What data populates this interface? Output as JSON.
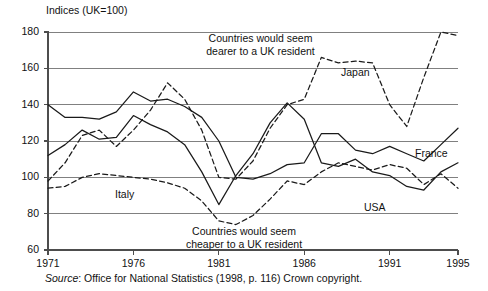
{
  "axis_title": "Indices (UK=100)",
  "source_prefix": "Source",
  "source_text": ": Office for National Statistics (1998, p. 116) Crown copyright.",
  "annotations": {
    "top_line1": "Countries would seem",
    "top_line2": "dearer to a UK resident",
    "bottom_line1": "Countries would seem",
    "bottom_line2": "cheaper to a UK resident"
  },
  "series_labels": {
    "japan": "Japan",
    "france": "France",
    "usa": "USA",
    "italy": "Italy"
  },
  "chart_data": {
    "type": "line",
    "title": "",
    "subtitle": "",
    "xlabel": "",
    "ylabel": "Indices (UK=100)",
    "xlim": [
      1971,
      1995
    ],
    "ylim": [
      60,
      180
    ],
    "ytick_labels": [
      "180",
      "160",
      "140",
      "120",
      "100",
      "80",
      "60"
    ],
    "ytick_values": [
      180,
      160,
      140,
      120,
      100,
      80,
      60
    ],
    "xtick_labels": [
      "1971",
      "1976",
      "1981",
      "1986",
      "1991",
      "1995"
    ],
    "xtick_values": [
      1971,
      1976,
      1981,
      1986,
      1991,
      1995
    ],
    "grid": "horizontal",
    "legend_position": "inline-annotations",
    "x": [
      1971,
      1972,
      1973,
      1974,
      1975,
      1976,
      1977,
      1978,
      1979,
      1980,
      1981,
      1982,
      1983,
      1984,
      1985,
      1986,
      1987,
      1988,
      1989,
      1990,
      1991,
      1992,
      1993,
      1994,
      1995
    ],
    "series": [
      {
        "name": "Japan",
        "style": "dashed",
        "values": [
          98,
          108,
          123,
          126,
          117,
          126,
          137,
          152,
          143,
          126,
          100,
          99,
          109,
          127,
          140,
          143,
          166,
          163,
          164,
          163,
          140,
          128,
          155,
          180,
          178
        ]
      },
      {
        "name": "France",
        "style": "solid",
        "values": [
          140,
          133,
          133,
          132,
          136,
          147,
          142,
          143,
          139,
          133,
          120,
          100,
          99,
          102,
          107,
          108,
          124,
          124,
          115,
          113,
          117,
          113,
          109,
          118,
          127
        ]
      },
      {
        "name": "USA",
        "style": "solid",
        "values": [
          112,
          118,
          126,
          121,
          122,
          134,
          129,
          125,
          118,
          103,
          85,
          101,
          113,
          130,
          141,
          132,
          108,
          106,
          110,
          103,
          101,
          95,
          93,
          103,
          108
        ]
      },
      {
        "name": "Italy",
        "style": "dashed",
        "values": [
          94,
          95,
          100,
          102,
          101,
          100,
          99,
          97,
          94,
          87,
          76,
          74,
          79,
          88,
          98,
          96,
          103,
          108,
          106,
          104,
          107,
          105,
          96,
          102,
          94
        ]
      }
    ],
    "annotations": [
      {
        "text": "Countries would seem dearer to a UK resident",
        "x": 1981,
        "y": 172
      },
      {
        "text": "Countries would seem cheaper to a UK resident",
        "x": 1980,
        "y": 68
      }
    ],
    "colors": {
      "line": "#1a1a1a",
      "grid": "#808080",
      "axis": "#4d4d4d",
      "background": "#ffffff"
    }
  }
}
